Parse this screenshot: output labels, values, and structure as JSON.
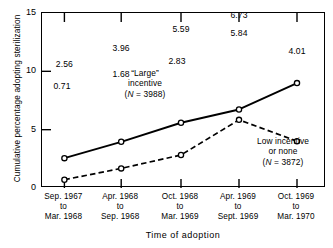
{
  "chart_data": {
    "type": "line",
    "title": "",
    "xlabel": "Time of adoption",
    "ylabel": "Cumulative percentage adopting sterilization",
    "ylim": [
      0,
      15
    ],
    "yticks": [
      0,
      5,
      10,
      15
    ],
    "ytick_labels": [
      "0",
      "5",
      "10",
      "15"
    ],
    "grid": false,
    "legend": "annotations-inline",
    "categories": [
      "Sep. 1967\nto\nMar. 1968",
      "Apr. 1968\nto\nSep. 1968",
      "Oct. 1968\nto\nMar. 1969",
      "Apr. 1969\nto\nSept. 1969",
      "Oct. 1969\nto\nMar. 1970"
    ],
    "xtick_labels": [
      {
        "line1": "Sep. 1967",
        "line2": "to",
        "line3": "Mar. 1968"
      },
      {
        "line1": "Apr. 1968",
        "line2": "to",
        "line3": "Sep. 1968"
      },
      {
        "line1": "Oct. 1968",
        "line2": "to",
        "line3": "Mar. 1969"
      },
      {
        "line1": "Apr. 1969",
        "line2": "to",
        "line3": "Sept. 1969"
      },
      {
        "line1": "Oct. 1969",
        "line2": "to",
        "line3": "Mar. 1970"
      }
    ],
    "series": [
      {
        "name": "“Large” incentive",
        "n": 3988,
        "style": "solid",
        "marker": "open-circle",
        "values": [
          2.56,
          3.96,
          5.59,
          6.73,
          8.99
        ],
        "value_labels": [
          "2.56",
          "3.96",
          "5.59",
          "6.73",
          "8.99"
        ]
      },
      {
        "name": "Low incentive or none",
        "n": 3872,
        "style": "dashed",
        "marker": "open-circle",
        "values": [
          0.71,
          1.68,
          2.83,
          5.84,
          4.01
        ],
        "value_labels": [
          "0.71",
          "1.68",
          "2.83",
          "5.84",
          "4.01"
        ]
      }
    ],
    "annotations": [
      {
        "id": "large-incentive",
        "line1": "“Large”",
        "line2": "incentive",
        "line3_pre": "(",
        "line3_ital": "N",
        "line3_post": " = 3988)"
      },
      {
        "id": "low-incentive",
        "line1": "Low incentive",
        "line2": "or none",
        "line3_pre": "(",
        "line3_ital": "N",
        "line3_post": " = 3872)"
      }
    ],
    "colors": {
      "line": "#000000",
      "marker_fill": "#ffffff",
      "axis": "#000000",
      "background": "#ffffff"
    }
  }
}
